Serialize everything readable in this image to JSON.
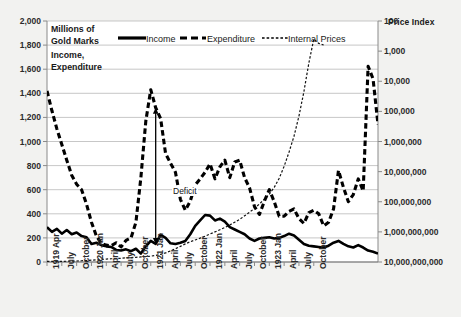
{
  "chart_data": {
    "type": "line",
    "title": "",
    "left_axis": {
      "label_lines": [
        "Millions of",
        "Gold Marks",
        "Income,",
        "Expenditure"
      ],
      "ticks": [
        "0",
        "200",
        "400",
        "600",
        "800",
        "1,000",
        "1,200",
        "1,400",
        "1,600",
        "1,800",
        "2,000"
      ],
      "ylim": [
        0,
        2000
      ],
      "scale": "linear"
    },
    "right_axis": {
      "label": "Price Index",
      "ticks": [
        "100",
        "1,000",
        "10,000",
        "100,000",
        "1,000,000",
        "10,000,000",
        "100,000,000",
        "1,000,000,000",
        "10,000,000,000"
      ],
      "ylim": [
        100,
        10000000000
      ],
      "scale": "log"
    },
    "grid": true,
    "legend": {
      "position": "top-inside",
      "entries": [
        {
          "name": "Income",
          "style": "solid-thick"
        },
        {
          "name": "Expenditure",
          "style": "dashed-thick"
        },
        {
          "name": "Internal Prices",
          "style": "dotted-thin"
        }
      ]
    },
    "xlabel": "",
    "x_tick_labels": [
      "1919 Apr",
      "July",
      "October",
      "1920 Jan",
      "April",
      "July",
      "October",
      "1921 Jan",
      "April",
      "July",
      "October",
      "1922 Jan",
      "April",
      "July",
      "October",
      "1923 Jan",
      "April",
      "July",
      "October"
    ],
    "x_tick_index": [
      0,
      3,
      6,
      9,
      12,
      15,
      18,
      21,
      24,
      27,
      30,
      33,
      36,
      39,
      42,
      45,
      48,
      51,
      54
    ],
    "annotations": [
      {
        "text": "Deficit",
        "x_index": 22,
        "note": "double-headed arrow between Income and Expenditure"
      }
    ],
    "series": [
      {
        "name": "Income",
        "axis": "left",
        "values": [
          290,
          250,
          275,
          235,
          265,
          230,
          245,
          215,
          205,
          150,
          160,
          140,
          130,
          125,
          100,
          95,
          105,
          90,
          110,
          70,
          130,
          175,
          150,
          225,
          200,
          155,
          150,
          160,
          175,
          230,
          300,
          345,
          390,
          385,
          345,
          360,
          335,
          290,
          270,
          250,
          230,
          195,
          175,
          195,
          200,
          205,
          195,
          200,
          215,
          235,
          220,
          185,
          150,
          135,
          130,
          125,
          120,
          135,
          160,
          175,
          150,
          130,
          120,
          140,
          120,
          95,
          85,
          70
        ]
      },
      {
        "name": "Expenditure",
        "axis": "left",
        "values": [
          1420,
          1255,
          1105,
          975,
          845,
          720,
          645,
          600,
          480,
          330,
          215,
          155,
          140,
          135,
          160,
          125,
          180,
          200,
          330,
          700,
          1170,
          1430,
          1280,
          1190,
          900,
          820,
          745,
          520,
          430,
          505,
          640,
          690,
          745,
          815,
          690,
          790,
          845,
          700,
          830,
          845,
          700,
          615,
          460,
          395,
          505,
          600,
          500,
          380,
          380,
          420,
          440,
          360,
          320,
          410,
          430,
          400,
          300,
          330,
          440,
          760,
          620,
          500,
          560,
          690,
          590,
          1625,
          1520,
          1140
        ]
      },
      {
        "name": "Internal Prices",
        "axis": "right",
        "values": [
          105,
          105,
          105,
          105,
          106,
          107,
          108,
          110,
          112,
          115,
          118,
          122,
          125,
          128,
          130,
          133,
          137,
          140,
          143,
          147,
          150,
          156,
          165,
          180,
          200,
          235,
          275,
          330,
          400,
          470,
          540,
          620,
          720,
          850,
          1000,
          1180,
          1400,
          1700,
          2100,
          2600,
          3400,
          4500,
          6000,
          8500,
          12000,
          18000,
          30000,
          60000,
          150000,
          450000,
          1500000,
          7000000,
          45000000,
          400000000,
          2500000000,
          1800000000,
          1600000000
        ]
      }
    ]
  }
}
